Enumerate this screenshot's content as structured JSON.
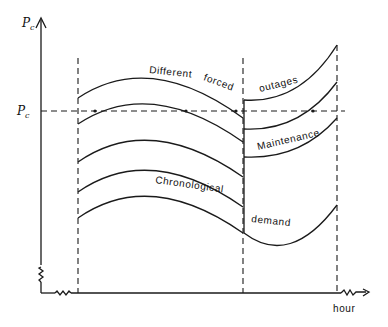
{
  "figure": {
    "y_axis_label": "P",
    "y_axis_label_sub": "c",
    "pc_level_label": "P",
    "pc_level_label_sub": "c",
    "x_axis_label": "hour"
  },
  "annotations": {
    "different": "Different",
    "forced": "forced",
    "outages": "outages",
    "maintenance": "Maintenance",
    "chronological": "Chronological",
    "demand": "demand"
  },
  "segments": {
    "left": {
      "curves_count": 5,
      "description": "Five load curves stacked; top curve crosses Pc level"
    },
    "right": {
      "curves_count": 4,
      "description": "Load curves after maintenance step; second curve crosses Pc level"
    }
  },
  "colors": {
    "ink": "#1a1a1a",
    "background": "#ffffff"
  }
}
